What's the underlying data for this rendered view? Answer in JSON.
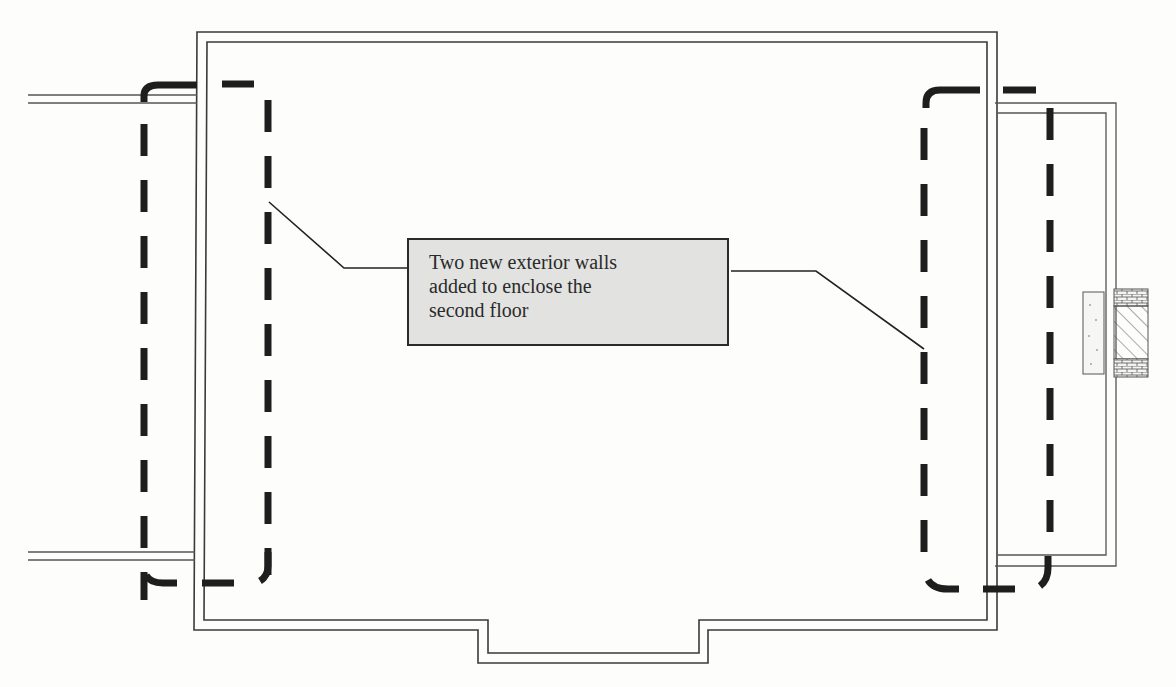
{
  "diagram": {
    "type": "architectural floor plan (second floor)",
    "callout": {
      "lines": [
        "Two new exterior walls",
        "added to enclose the",
        "second floor"
      ]
    },
    "annotations": {
      "left_new_wall": "dashed new exterior wall (left)",
      "right_new_wall": "dashed new exterior wall (right)",
      "chimney": "chimney / masonry detail on right exterior"
    },
    "colors": {
      "wall_line": "#3a3a3a",
      "new_wall_dash": "#1e1e1e",
      "callout_fill": "#e2e2e0",
      "background": "#fdfdfc"
    }
  }
}
